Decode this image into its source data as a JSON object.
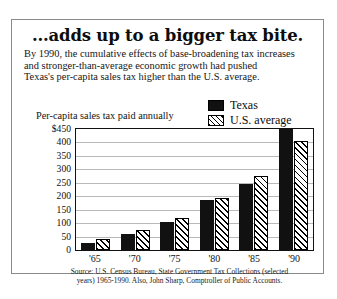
{
  "title": "...adds up to a bigger tax bite.",
  "subtitle_lines": [
    "By 1990, the cumulative effects of base-broadening tax increases",
    "and stronger-than-average economic growth had pushed",
    "Texas's per-capita sales tax higher than the U.S. average."
  ],
  "axis_caption": "Per-capita sales tax paid annually",
  "legend": [
    {
      "label": "Texas",
      "swatch": "solid-black-swatch",
      "color": "#111111"
    },
    {
      "label": "U.S. average",
      "swatch": "diagonal-hatch-swatch",
      "color": "#000000"
    }
  ],
  "source_lines": [
    "Source: U.S. Census Bureau, State Government Tax Collections (selected",
    "years) 1965-1990. Also, John Sharp, Comptroller of Public Accounts."
  ],
  "chart_data": {
    "type": "bar",
    "title": "...adds up to a bigger tax bite.",
    "xlabel": "",
    "ylabel": "Per-capita sales tax paid annually",
    "categories": [
      "'65",
      "'70",
      "'75",
      "'80",
      "'85",
      "'90"
    ],
    "series": [
      {
        "name": "Texas",
        "values": [
          25,
          60,
          105,
          185,
          245,
          450
        ]
      },
      {
        "name": "U.S. average",
        "values": [
          40,
          75,
          120,
          195,
          275,
          405
        ]
      }
    ],
    "ylim": [
      0,
      450
    ],
    "yticks": [
      0,
      50,
      100,
      150,
      200,
      250,
      300,
      350,
      400,
      450
    ],
    "ytick_labels": [
      "0",
      "50",
      "100",
      "150",
      "200",
      "250",
      "300",
      "350",
      "400",
      "$450"
    ],
    "grid": true,
    "legend_position": "top-right"
  }
}
